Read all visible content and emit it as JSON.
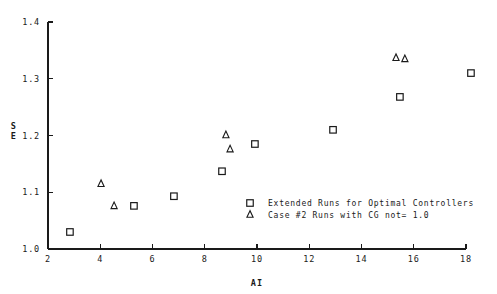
{
  "chart_data": {
    "type": "scatter",
    "title": "",
    "xlabel": "AI",
    "ylabel": "SE",
    "ylabel_lines": [
      "S",
      "E"
    ],
    "xlim": [
      2,
      18
    ],
    "ylim": [
      1.0,
      1.4
    ],
    "xticks": [
      2,
      4,
      6,
      8,
      10,
      12,
      14,
      16,
      18
    ],
    "xtick_labels": [
      "2",
      "4",
      "6",
      "8",
      "10",
      "12",
      "14",
      "16",
      "18"
    ],
    "yticks": [
      1.0,
      1.1,
      1.2,
      1.3,
      1.4
    ],
    "ytick_labels": [
      "1.0",
      "1.1",
      "1.2",
      "1.3",
      "1.4"
    ],
    "grid": false,
    "legend_position": "center-right-lower",
    "series": [
      {
        "name": "Extended Runs for Optimal Controllers",
        "marker": "square",
        "points": [
          {
            "x": 2.84,
            "y": 1.03
          },
          {
            "x": 5.29,
            "y": 1.076
          },
          {
            "x": 6.82,
            "y": 1.093
          },
          {
            "x": 8.66,
            "y": 1.137
          },
          {
            "x": 9.92,
            "y": 1.185
          },
          {
            "x": 12.91,
            "y": 1.21
          },
          {
            "x": 15.47,
            "y": 1.268
          },
          {
            "x": 18.19,
            "y": 1.31
          }
        ]
      },
      {
        "name": "Case #2 Runs with CG not= 1.0",
        "marker": "triangle",
        "points": [
          {
            "x": 4.03,
            "y": 1.115
          },
          {
            "x": 4.53,
            "y": 1.076
          },
          {
            "x": 8.81,
            "y": 1.201
          },
          {
            "x": 8.97,
            "y": 1.176
          },
          {
            "x": 15.32,
            "y": 1.337
          },
          {
            "x": 15.66,
            "y": 1.335
          }
        ]
      }
    ]
  },
  "legend": {
    "entries": [
      {
        "marker": "square",
        "label": "Extended Runs for Optimal Controllers"
      },
      {
        "marker": "triangle",
        "label": "Case #2 Runs with CG not= 1.0"
      }
    ]
  },
  "colors": {
    "axis": "#1a1a1a",
    "marker": "#1a1a1a",
    "background": "#ffffff"
  }
}
